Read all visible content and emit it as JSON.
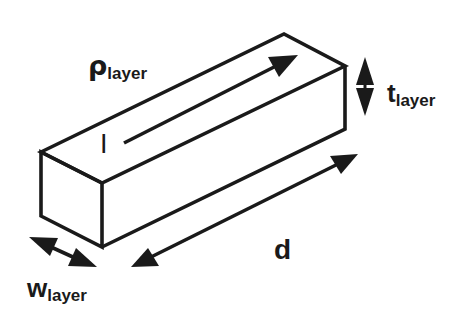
{
  "diagram": {
    "title": "",
    "colors": {
      "stroke": "#1a1a1a",
      "background": "#ffffff"
    },
    "labels": {
      "resistivity": {
        "main": "ρ",
        "sub": "layer"
      },
      "thickness": {
        "main": "t",
        "sub": "layer"
      },
      "width": {
        "main": "w",
        "sub": "layer"
      },
      "length": {
        "main": "d",
        "sub": ""
      },
      "current": {
        "main": "I",
        "sub": ""
      }
    },
    "arrows": [
      {
        "name": "current-arrow",
        "type": "single",
        "direction": "along length"
      },
      {
        "name": "thickness-arrow",
        "type": "double",
        "direction": "vertical"
      },
      {
        "name": "width-arrow",
        "type": "double",
        "direction": "across width"
      },
      {
        "name": "length-arrow",
        "type": "double",
        "direction": "along length"
      }
    ]
  }
}
